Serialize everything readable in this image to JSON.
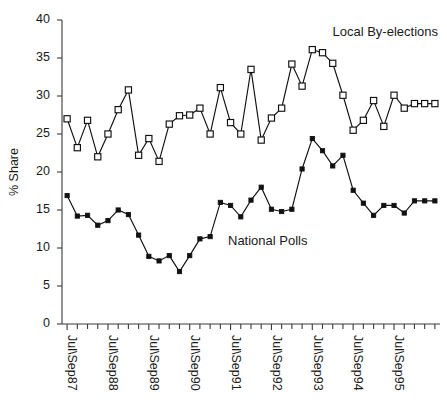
{
  "chart_data": {
    "type": "line",
    "title": "",
    "subtitle": "",
    "xlabel": "",
    "ylabel": "% Share",
    "ylim": [
      0,
      40
    ],
    "ytick_values": [
      0,
      5,
      10,
      15,
      20,
      25,
      30,
      35,
      40
    ],
    "ytick_labels": [
      "0",
      "5",
      "10",
      "15",
      "20",
      "25",
      "30",
      "35",
      "40"
    ],
    "grid": false,
    "legend_position": "inline-annotations",
    "x_major_labels": [
      "Jul\\Sep87",
      "Jul\\Sep88",
      "Jul\\Sep89",
      "Jul\\Sep90",
      "Jul\\Sep91",
      "Jul\\Sep92",
      "Jul\\Sep93",
      "Jul\\Sep94",
      "Jul\\Sep95"
    ],
    "x_major_indices": [
      0,
      4,
      8,
      12,
      16,
      20,
      24,
      28,
      32
    ],
    "n_points": 37,
    "series": [
      {
        "name": "Local By-elections",
        "marker": "open-square",
        "values": [
          27.0,
          23.2,
          26.8,
          22.0,
          25.0,
          28.2,
          30.8,
          22.2,
          24.4,
          21.4,
          26.3,
          27.4,
          27.5,
          28.4,
          25.0,
          31.1,
          26.5,
          25.0,
          33.5,
          24.2,
          27.1,
          28.4,
          34.2,
          31.3,
          36.1,
          35.7,
          34.3,
          30.1,
          25.5,
          26.8,
          29.4,
          26.0,
          30.1,
          28.4,
          29.0,
          29.0,
          29.0
        ]
      },
      {
        "name": "National Polls",
        "marker": "filled-square",
        "values": [
          16.9,
          14.2,
          14.3,
          13.0,
          13.6,
          15.0,
          14.4,
          11.7,
          8.9,
          8.3,
          9.0,
          6.9,
          9.0,
          11.2,
          11.5,
          16.0,
          15.6,
          14.1,
          16.3,
          18.0,
          15.1,
          14.8,
          15.1,
          20.4,
          24.4,
          22.8,
          20.8,
          22.2,
          17.6,
          15.9,
          14.3,
          15.6,
          15.6,
          14.6,
          16.2,
          16.2,
          16.2
        ]
      }
    ],
    "annotations": [
      {
        "text": "Local By-elections",
        "series": "Local By-elections"
      },
      {
        "text": "National Polls",
        "series": "National Polls"
      }
    ]
  },
  "colors": {
    "ink": "#111111",
    "axis": "#3a3a3a",
    "background": "#ffffff"
  }
}
